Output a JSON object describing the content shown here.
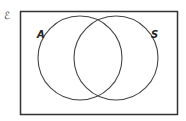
{
  "diagram": {
    "type": "venn",
    "universal_symbol": "ℰ",
    "sets": [
      {
        "label": "A",
        "cx": 80,
        "cy": 58,
        "r": 42
      },
      {
        "label": "S",
        "cx": 116,
        "cy": 58,
        "r": 42
      }
    ],
    "frame": {
      "x": 20,
      "y": 11,
      "width": 158,
      "height": 104
    },
    "colors": {
      "stroke": "#444444",
      "frame": "#333333",
      "background": "#ffffff"
    }
  }
}
